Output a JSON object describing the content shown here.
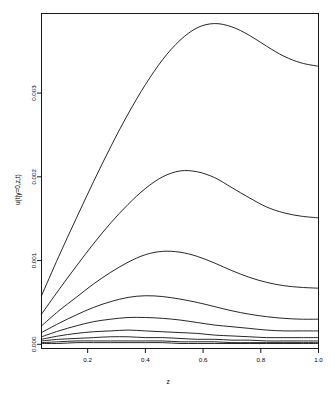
{
  "chart_data": {
    "type": "line",
    "title": "",
    "xlabel": "z",
    "ylabel": "u(t|y=0,z,t)",
    "xlim": [
      0.04,
      1.0
    ],
    "ylim": [
      -5e-05,
      0.00395
    ],
    "grid": false,
    "legend": "none",
    "box": true,
    "xticks": [
      0.2,
      0.4,
      0.6,
      0.8,
      1.0
    ],
    "xticklabels": [
      "0.2",
      "0.4",
      "0.6",
      "0.8",
      "1.0"
    ],
    "yticks": [
      0.0,
      0.001,
      0.002,
      0.003
    ],
    "yticklabels": [
      "0.000",
      "0.001",
      "0.002",
      "0.003"
    ],
    "x": [
      0.04,
      0.1,
      0.16,
      0.22,
      0.28,
      0.34,
      0.4,
      0.46,
      0.52,
      0.58,
      0.64,
      0.7,
      0.76,
      0.82,
      0.88,
      0.94,
      1.0
    ],
    "series": [
      {
        "name": "curve-1",
        "values": [
          0.00058,
          0.00105,
          0.0015,
          0.00194,
          0.00236,
          0.00275,
          0.0031,
          0.0034,
          0.00363,
          0.00378,
          0.00383,
          0.00379,
          0.00369,
          0.00356,
          0.00344,
          0.00336,
          0.00332
        ]
      },
      {
        "name": "curve-2",
        "values": [
          0.00036,
          0.00065,
          0.00093,
          0.0012,
          0.00145,
          0.00167,
          0.00186,
          0.002,
          0.00207,
          0.00206,
          0.00199,
          0.00187,
          0.00175,
          0.00164,
          0.00157,
          0.00153,
          0.00151
        ]
      },
      {
        "name": "curve-3",
        "values": [
          0.00022,
          0.0004,
          0.00056,
          0.00072,
          0.00086,
          0.00098,
          0.00107,
          0.00111,
          0.0011,
          0.00105,
          0.00097,
          0.00088,
          0.0008,
          0.00074,
          0.0007,
          0.00068,
          0.00067
        ]
      },
      {
        "name": "curve-4",
        "values": [
          0.00014,
          0.00025,
          0.00035,
          0.00044,
          0.00051,
          0.00056,
          0.00058,
          0.00057,
          0.00054,
          0.0005,
          0.00045,
          0.0004,
          0.00036,
          0.00033,
          0.00031,
          0.0003,
          0.0003
        ]
      },
      {
        "name": "curve-5",
        "values": [
          9e-05,
          0.00016,
          0.00022,
          0.00027,
          0.0003,
          0.00032,
          0.00032,
          0.00031,
          0.00029,
          0.00026,
          0.00023,
          0.00021,
          0.00019,
          0.00017,
          0.00016,
          0.00016,
          0.00016
        ]
      },
      {
        "name": "curve-6",
        "values": [
          6e-05,
          0.0001,
          0.00013,
          0.00015,
          0.00016,
          0.00017,
          0.00016,
          0.00015,
          0.00014,
          0.00013,
          0.00011,
          0.0001,
          9e-05,
          8e-05,
          8e-05,
          8e-05,
          8e-05
        ]
      },
      {
        "name": "curve-7",
        "values": [
          4e-05,
          6e-05,
          7e-05,
          8e-05,
          9e-05,
          9e-05,
          8e-05,
          8e-05,
          7e-05,
          6e-05,
          6e-05,
          5e-05,
          5e-05,
          4e-05,
          4e-05,
          4e-05,
          4e-05
        ]
      },
      {
        "name": "curve-8",
        "values": [
          2e-05,
          3e-05,
          4e-05,
          4e-05,
          4e-05,
          4e-05,
          4e-05,
          4e-05,
          3e-05,
          3e-05,
          3e-05,
          2e-05,
          2e-05,
          2e-05,
          2e-05,
          2e-05,
          2e-05
        ]
      },
      {
        "name": "curve-9",
        "values": [
          1e-05,
          1e-05,
          2e-05,
          2e-05,
          2e-05,
          2e-05,
          2e-05,
          2e-05,
          1e-05,
          1e-05,
          1e-05,
          1e-05,
          1e-05,
          1e-05,
          1e-05,
          1e-05,
          1e-05
        ]
      }
    ],
    "line_color": "#000000",
    "background": "#ffffff"
  }
}
